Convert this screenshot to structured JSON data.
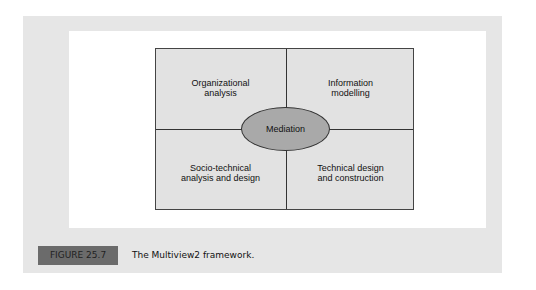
{
  "diagram": {
    "quadrants": [
      {
        "line1": "Organizational",
        "line2": "analysis"
      },
      {
        "line1": "Information",
        "line2": "modelling"
      },
      {
        "line1": "Socio-technical",
        "line2": "analysis and design"
      },
      {
        "line1": "Technical design",
        "line2": "and construction"
      }
    ],
    "center": "Mediation"
  },
  "figure": {
    "label": "FIGURE 25.7",
    "caption": "The Multiview2 framework."
  },
  "colors": {
    "panel": "#e6e6e6",
    "quadrant_fill": "#e2e2e2",
    "ellipse_fill": "#a9a9a9",
    "label_fill": "#6b6b6b"
  }
}
